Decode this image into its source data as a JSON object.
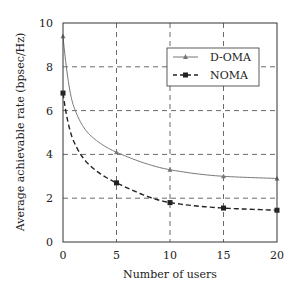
{
  "chart_data": {
    "type": "line",
    "title": "",
    "xlabel": "Number of users",
    "ylabel": "Average achievable rate (bpsec/Hz)",
    "xlim": [
      0,
      20
    ],
    "ylim": [
      0,
      10
    ],
    "xticks": [
      "0",
      "5",
      "10",
      "15",
      "20"
    ],
    "yticks": [
      "0",
      "2",
      "4",
      "6",
      "8",
      "10"
    ],
    "grid": true,
    "legend_position": "upper right",
    "x": [
      0,
      5,
      10,
      15,
      20
    ],
    "series": [
      {
        "name": "D-OMA",
        "style": "solid",
        "marker": "triangle",
        "color": "#777777",
        "values": [
          9.4,
          4.1,
          3.3,
          3.0,
          2.9
        ]
      },
      {
        "name": "NOMA",
        "style": "dashed",
        "marker": "square",
        "color": "#222222",
        "values": [
          6.8,
          2.7,
          1.8,
          1.55,
          1.45
        ]
      }
    ]
  }
}
